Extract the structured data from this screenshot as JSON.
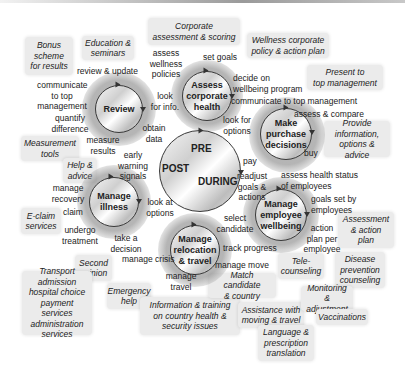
{
  "boxes": {
    "bonus": "Bonus\nscheme\nfor results",
    "education": "Education &\nseminars",
    "corporate_assessment": "Corporate\nassessment & scoring",
    "wellness_policy": "Wellness corporate\npolicy & action plan",
    "present_top": "Present to\ntop management",
    "provide_info": "Provide\ninformation,\noptions & advice",
    "measurement": "Measurement\ntools",
    "help_advice": "Help &\nadvice",
    "eclaim": "E-claim\nservices",
    "assessment_action": "Assessment\n& action\nplan",
    "second_opinion": "Second\nopinion",
    "transport": "Transport\nadmission\nhospital choice\npayment services\nadministration\nservices",
    "emergency": "Emergency\nhelp",
    "info_training": "Information & training\non country health &\nsecurity issues",
    "match_candidate": "Match candidate\n& country",
    "assistance_moving": "Assistance with\nmoving & travel",
    "language": "Language &\nprescription\ntranslation",
    "telecounseling": "Tele-\ncounseling",
    "disease_prevention": "Disease\nprevention\ncounseling",
    "monitoring": "Monitoring &\nadjustment",
    "vaccinations": "Vaccinations"
  },
  "circles": {
    "review": "Review",
    "assess": "Assess\ncorporate\nhealth",
    "purchase": "Make\npurchase\ndecisions",
    "illness": "Manage\nillness",
    "wellbeing": "Manage\nemployee\nwellbeing",
    "relocation": "Manage\nrelocation\n& travel"
  },
  "center": {
    "pre": "PRE",
    "post": "POST",
    "during": "DURING"
  },
  "labels": {
    "review_update": "review & update",
    "communicate_top": "communicate\nto top\nmanagement",
    "quantify": "quantify\ndifference",
    "measure_results": "measure\nresults",
    "look_info": "look\nfor info.",
    "obtain_data": "obtain\ndata",
    "assess_wellness": "assess\nwellness\npolicies",
    "set_goals": "set goals",
    "decide_on": "decide on\nwellbeing program",
    "communicate_top2": "communicate to top management",
    "look_options": "look for\noptions",
    "assess_compare": "assess & compare",
    "buy": "buy",
    "pay": "pay",
    "readjust": "readjust\ngoals &\nactions",
    "assess_health": "assess health status\nof employees",
    "goals_set": "goals set by\nemployees",
    "action_plan": "action\nplan per\nemployee",
    "early_warning": "early\nwarning\nsignals",
    "manage_recovery": "manage\nrecovery",
    "claim": "claim",
    "undergo": "undergo\ntreatment",
    "look_at_options": "look at\noptions",
    "take_decision": "take a\ndecision",
    "select_candidate": "select\ncandidate",
    "track_progress": "track progress",
    "manage_crisis": "manage crisis",
    "manage_travel": "manage\ntravel",
    "manage_move": "manage move"
  }
}
